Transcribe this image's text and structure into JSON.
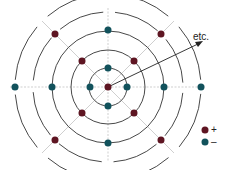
{
  "diagram": {
    "center": [
      108,
      87
    ],
    "ring_radii": [
      19,
      37,
      56,
      75,
      93
    ],
    "colors": {
      "positive": "#5e1522",
      "negative": "#12525c",
      "ring": "#333333",
      "axis": "#cccccc"
    },
    "annotation": "etc.",
    "legend": [
      {
        "label": "+",
        "color": "#5e1522"
      },
      {
        "label": "–",
        "color": "#12525c"
      }
    ]
  }
}
